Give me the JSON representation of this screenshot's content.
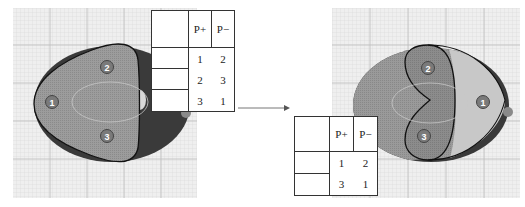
{
  "figure": {
    "left_panel": {
      "state": "before",
      "markers": [
        {
          "id": "1",
          "label": "1"
        },
        {
          "id": "2",
          "label": "2"
        },
        {
          "id": "3",
          "label": "3"
        }
      ],
      "table": {
        "headers": [
          "",
          "P+",
          "P−"
        ],
        "rows": [
          [
            "",
            "1",
            "2"
          ],
          [
            "",
            "2",
            "3"
          ],
          [
            "",
            "3",
            "1"
          ]
        ]
      }
    },
    "right_panel": {
      "state": "after",
      "markers": [
        {
          "id": "1",
          "label": "1"
        },
        {
          "id": "2",
          "label": "2"
        },
        {
          "id": "3",
          "label": "3"
        }
      ],
      "table": {
        "headers": [
          "",
          "P+",
          "P−"
        ],
        "rows": [
          [
            "",
            "1",
            "2"
          ],
          [
            "",
            "3",
            "1"
          ]
        ]
      }
    },
    "arrow": {
      "direction": "right"
    },
    "colors": {
      "grid_bg": "#eeeeee",
      "grid_line": "#c8c8c8",
      "ellipse_dark": "#3a3a3a",
      "region_mid": "#9a9a9a",
      "region_light": "#c4c4c4",
      "marker_fill": "#777777",
      "outline": "#111111"
    }
  }
}
